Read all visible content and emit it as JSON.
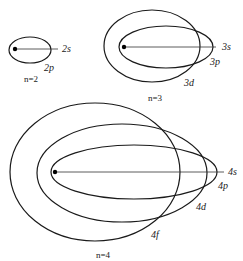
{
  "diagram": {
    "colors": {
      "stroke": "#1a1a1a",
      "text": "#222222",
      "background": "#ffffff"
    },
    "groups": [
      {
        "shell": "n=2",
        "label": "n=2",
        "nucleus": {
          "cx": 15,
          "cy": 49
        },
        "axis_line": {
          "x1": 15,
          "y1": 49,
          "x2": 58,
          "y2": 49
        },
        "orbits": [
          {
            "name": "2p",
            "cx": 30,
            "cy": 50,
            "rx": 21,
            "ry": 13
          }
        ],
        "labels": [
          {
            "text": "2s",
            "x": 62,
            "y": 52
          },
          {
            "text": "2p",
            "x": 44,
            "y": 71
          }
        ],
        "shell_label_pos": {
          "x": 24,
          "y": 82
        }
      },
      {
        "shell": "n=3",
        "label": "n=3",
        "nucleus": {
          "cx": 124,
          "cy": 47
        },
        "axis_line": {
          "x1": 124,
          "y1": 47,
          "x2": 216,
          "y2": 47
        },
        "orbits": [
          {
            "name": "3d",
            "cx": 152,
            "cy": 46,
            "rx": 48,
            "ry": 36
          },
          {
            "name": "3p",
            "cx": 166,
            "cy": 47,
            "rx": 47,
            "ry": 21
          }
        ],
        "labels": [
          {
            "text": "3s",
            "x": 222,
            "y": 50
          },
          {
            "text": "3p",
            "x": 210,
            "y": 65
          },
          {
            "text": "3d",
            "x": 184,
            "y": 86
          }
        ],
        "shell_label_pos": {
          "x": 148,
          "y": 101
        }
      },
      {
        "shell": "n=4",
        "label": "n=4",
        "nucleus": {
          "cx": 55,
          "cy": 172
        },
        "axis_line": {
          "x1": 55,
          "y1": 172,
          "x2": 224,
          "y2": 172
        },
        "orbits": [
          {
            "name": "4f",
            "cx": 95,
            "cy": 172,
            "rx": 85,
            "ry": 69
          },
          {
            "name": "4d",
            "cx": 122,
            "cy": 173,
            "rx": 85,
            "ry": 49
          },
          {
            "name": "4p",
            "cx": 134,
            "cy": 172,
            "rx": 83,
            "ry": 27
          }
        ],
        "labels": [
          {
            "text": "4s",
            "x": 228,
            "y": 175
          },
          {
            "text": "4p",
            "x": 218,
            "y": 189
          },
          {
            "text": "4d",
            "x": 196,
            "y": 210
          },
          {
            "text": "4f",
            "x": 151,
            "y": 238
          }
        ],
        "shell_label_pos": {
          "x": 96,
          "y": 258
        }
      }
    ]
  }
}
